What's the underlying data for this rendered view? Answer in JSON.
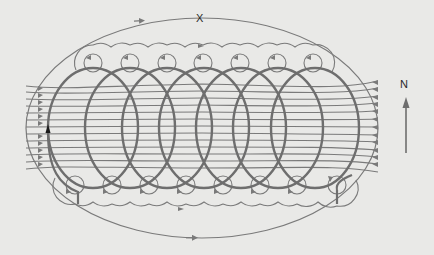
{
  "labels": {
    "point_x": "X",
    "north": "N"
  },
  "colors": {
    "background": "#e9e9e7",
    "field_line": "#7a7a7a",
    "coil": "#6e6e6e",
    "lead_arrow": "#1a1a1a",
    "text": "#2a2a2a"
  },
  "geometry": {
    "outer_loop": {
      "cx": 202,
      "cy": 128,
      "rx": 176,
      "ry": 110,
      "arrow_top_x": 138,
      "arrow_bottom_x": 192
    },
    "coil_loops": {
      "count": 7,
      "first_left": 48,
      "spacing": 37,
      "width": 90,
      "top": 68,
      "bottom": 188
    },
    "top_small_circles_x": [
      93,
      130,
      167,
      203,
      240,
      277,
      313
    ],
    "top_small_circles_y": 63,
    "bottom_small_circles_x": [
      75,
      112,
      149,
      186,
      223,
      260,
      297,
      337
    ],
    "bottom_small_circles_y": 185,
    "field_line_count": 13,
    "north_arrow": {
      "x": 406,
      "y_start": 153,
      "y_end": 100
    }
  }
}
